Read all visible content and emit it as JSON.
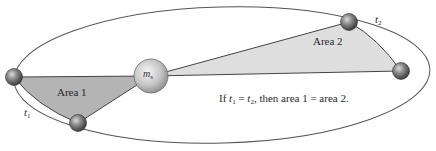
{
  "diagram": {
    "labels": {
      "area1": "Area 1",
      "area2": "Area 2",
      "t1_var": "t",
      "t1_sub": "1",
      "t2_var": "t",
      "t2_sub": "2",
      "sun_var": "m",
      "sun_sub": "s"
    },
    "caption": {
      "prefix": "If ",
      "t1_var": "t",
      "t1_sub": "1",
      "eq": " = ",
      "t2_var": "t",
      "t2_sub": "2",
      "suffix": ", then area 1 = area 2."
    },
    "colors": {
      "orbit": "#555555",
      "area1_fill": "#b4b4b4",
      "area2_fill": "#dcdcdc",
      "wedge_stroke": "#444444",
      "planet": "#6e6e6e",
      "sun": "#c8c8c8"
    }
  }
}
